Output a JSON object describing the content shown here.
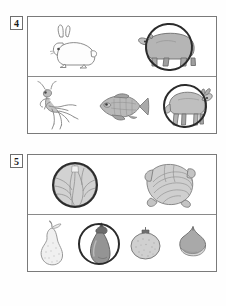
{
  "worksheet": {
    "questions": [
      {
        "number": "4",
        "rows": [
          {
            "items": [
              {
                "name": "rabbit",
                "style": "outline",
                "selected": false
              },
              {
                "name": "bear",
                "style": "shaded",
                "selected": true
              }
            ]
          },
          {
            "items": [
              {
                "name": "praying-mantis",
                "style": "shaded",
                "selected": false
              },
              {
                "name": "carp-fish",
                "style": "shaded",
                "selected": false
              },
              {
                "name": "goat",
                "style": "shaded",
                "selected": true
              }
            ]
          }
        ]
      },
      {
        "number": "5",
        "rows": [
          {
            "items": [
              {
                "name": "cabbage",
                "style": "shaded",
                "selected": true
              },
              {
                "name": "cabbage-head",
                "style": "shaded",
                "selected": false
              }
            ]
          },
          {
            "items": [
              {
                "name": "pear",
                "style": "outline",
                "selected": false
              },
              {
                "name": "eggplant",
                "style": "shaded",
                "selected": true
              },
              {
                "name": "mandarin-orange",
                "style": "shaded",
                "selected": false
              },
              {
                "name": "chestnut",
                "style": "shaded",
                "selected": false
              }
            ]
          }
        ]
      }
    ]
  },
  "colors": {
    "ring": "#2b2b2b",
    "border": "#7a7a7a",
    "outline": "#8d8d8d",
    "fill_light": "#f3f3f3",
    "fill_mid": "#b8b8b8",
    "fill_dark": "#8a8a8a",
    "ink": "#1a1a1a",
    "page": "#ffffff"
  }
}
